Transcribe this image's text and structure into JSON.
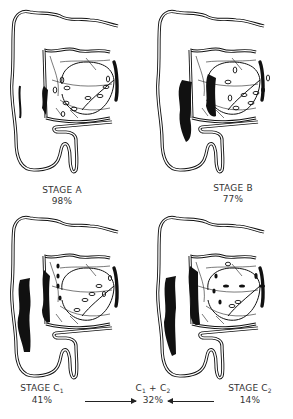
{
  "figure": {
    "panels": [
      {
        "id": "A",
        "label": "STAGE A",
        "value": "98%"
      },
      {
        "id": "B",
        "label": "STAGE B",
        "value": "77%"
      },
      {
        "id": "C1",
        "label_main": "STAGE C",
        "label_sub": "1",
        "value": "41%"
      },
      {
        "id": "C2",
        "label_main": "STAGE C",
        "label_sub": "2",
        "value": "14%"
      }
    ],
    "combined": {
      "c1": "C",
      "c1_sub": "1",
      "plus": " + ",
      "c2": "C",
      "c2_sub": "2",
      "value": "32%"
    },
    "arrows": [
      {
        "from": "STAGE C1",
        "to": "C1 + C2",
        "direction": "right"
      },
      {
        "from": "STAGE C2",
        "to": "C1 + C2",
        "direction": "left"
      }
    ],
    "colors": {
      "ink": "#111111",
      "background": "#ffffff",
      "text": "#333333"
    }
  }
}
